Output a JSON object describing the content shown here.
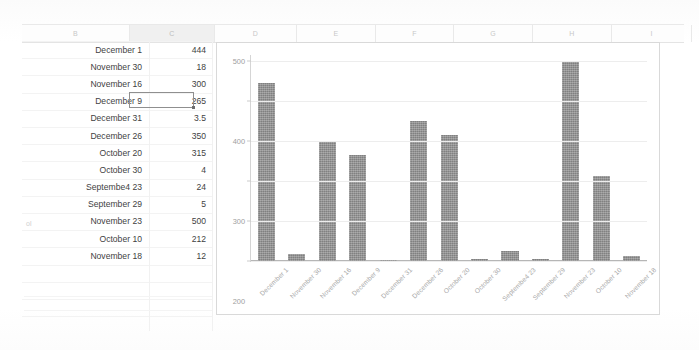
{
  "sheet": {
    "columns": [
      {
        "letter": "B",
        "selected": false
      },
      {
        "letter": "C",
        "selected": true
      },
      {
        "letter": "D",
        "selected": false
      },
      {
        "letter": "E",
        "selected": false
      },
      {
        "letter": "F",
        "selected": false
      },
      {
        "letter": "G",
        "selected": false
      },
      {
        "letter": "H",
        "selected": false
      },
      {
        "letter": "I",
        "selected": false
      }
    ],
    "rows": [
      {
        "label": "December 1",
        "value": "444"
      },
      {
        "label": "November 30",
        "value": "18"
      },
      {
        "label": "November 16",
        "value": "300"
      },
      {
        "label": "December 9",
        "value": "265"
      },
      {
        "label": "December 31",
        "value": "3.5"
      },
      {
        "label": "December 26",
        "value": "350"
      },
      {
        "label": "October 20",
        "value": "315"
      },
      {
        "label": "October 30",
        "value": "4"
      },
      {
        "label": "Septembe4 23",
        "value": "24"
      },
      {
        "label": "September 29",
        "value": "5"
      },
      {
        "label": "November 23",
        "value": "500"
      },
      {
        "label": "October 10",
        "value": "212"
      },
      {
        "label": "November 18",
        "value": "12"
      }
    ],
    "active_cell": {
      "value": "265",
      "row_label": "December 9"
    },
    "edge_artifact": "ol"
  },
  "chart_data": {
    "type": "bar",
    "title": "",
    "xlabel": "",
    "ylabel": "",
    "ylim": [
      0,
      500
    ],
    "yticks": [
      0,
      100,
      200,
      300,
      400,
      500
    ],
    "grid": true,
    "legend": "none",
    "bar_color": "#8d8d8d",
    "categories": [
      "December 1",
      "November 30",
      "November 16",
      "December 9",
      "December 31",
      "December 26",
      "October 20",
      "October 30",
      "Septembe4 23",
      "September 29",
      "November 23",
      "October 10",
      "November 18"
    ],
    "values": [
      444,
      18,
      300,
      265,
      3.5,
      350,
      315,
      4,
      24,
      5,
      500,
      212,
      12
    ]
  }
}
